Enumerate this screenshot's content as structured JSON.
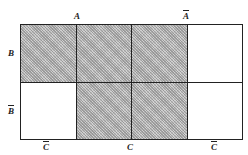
{
  "diagram": {
    "type": "karnaugh-map",
    "top_labels": [
      {
        "text": "A",
        "negated": false
      },
      {
        "text": "A",
        "negated": true
      }
    ],
    "side_labels": [
      {
        "text": "B",
        "negated": false
      },
      {
        "text": "B",
        "negated": true
      }
    ],
    "bottom_labels": [
      {
        "text": "C",
        "negated": true
      },
      {
        "text": "C",
        "negated": false
      },
      {
        "text": "C",
        "negated": true
      }
    ],
    "rows": [
      {
        "label": "B",
        "cells": [
          true,
          true,
          true,
          false
        ]
      },
      {
        "label": "B̄",
        "cells": [
          false,
          true,
          true,
          false
        ]
      }
    ],
    "colors": {
      "shade": "#bdbdbd",
      "line": "#222222",
      "background": "#ffffff"
    }
  }
}
